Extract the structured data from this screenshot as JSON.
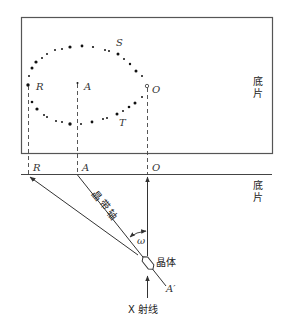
{
  "figure": {
    "film_label_top": [
      "底",
      "片"
    ],
    "film_label_bottom": [
      "底",
      "片"
    ],
    "points_on_film": {
      "R": "R",
      "A": "A",
      "O": "O",
      "S": "S",
      "T": "T"
    },
    "projection_labels": {
      "R": "R",
      "A": "A",
      "O": "O"
    },
    "zone_axis_label": [
      "晶",
      "带",
      "轴"
    ],
    "angle_label": "ω",
    "crystal_label": "晶体",
    "axis_end_label": "A′",
    "beam_label": "X 射线"
  },
  "colors": {
    "line": "#333333",
    "dot": "#111111",
    "background": "#ffffff"
  }
}
